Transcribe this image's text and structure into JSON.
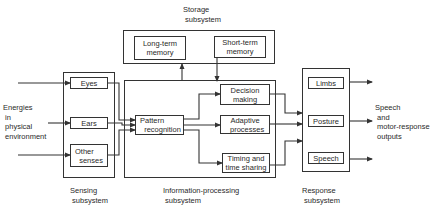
{
  "diagram": {
    "type": "block-diagram",
    "inputs_label": "Energies\n in\n physical\n environment",
    "outputs_label": "Speech\n and\n motor-response\n outputs",
    "subsystems": {
      "storage": {
        "label": "Storage\n subsystem",
        "blocks": [
          "Long-term\nmemory",
          "Short-term\nmemory"
        ]
      },
      "sensing": {
        "label": "Sensing\n subsystem",
        "blocks": [
          "Eyes",
          "Ears",
          "Other\n  senses"
        ]
      },
      "processing": {
        "label": "Information-processing\n subsystem",
        "blocks": [
          "Pattern\n  recognition",
          "Decision\nmaking",
          "Adaptive\n  processes",
          "Timing and\ntime sharing"
        ]
      },
      "response": {
        "label": "Response\n subsystem",
        "blocks": [
          "Limbs",
          "Posture",
          "Speech"
        ]
      }
    },
    "colors": {
      "line": "#333333",
      "text": "#2a2a2a",
      "background": "#ffffff"
    }
  }
}
